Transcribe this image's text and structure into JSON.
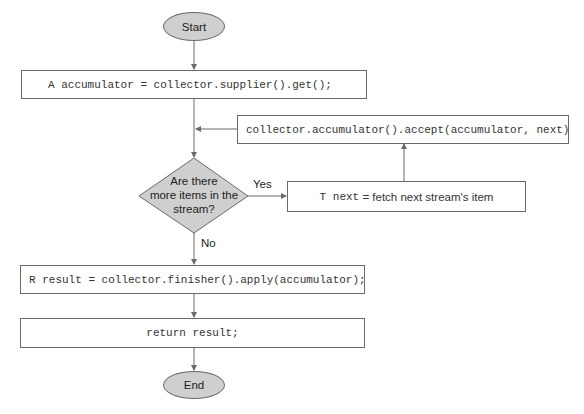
{
  "diagram": {
    "type": "flowchart",
    "colors": {
      "line": "#6b6b6b",
      "terminal_fill": "#cfcfcf",
      "decision_fill": "#cfcfcf",
      "box_fill": "#ffffff"
    },
    "nodes": {
      "start": {
        "label": "Start",
        "shape": "ellipse"
      },
      "init": {
        "label": "A accumulator = collector.supplier().get();",
        "shape": "rect"
      },
      "decision": {
        "shape": "diamond",
        "line1": "Are there",
        "line2": "more items in the",
        "line3": "stream?"
      },
      "fetch": {
        "shape": "rect",
        "code": "T next",
        "text": " = fetch next stream's item"
      },
      "accept": {
        "label": "collector.accumulator().accept(accumulator, next)",
        "shape": "rect"
      },
      "finish": {
        "label": "R result = collector.finisher().apply(accumulator);",
        "shape": "rect"
      },
      "return": {
        "label": "return result;",
        "shape": "rect"
      },
      "end": {
        "label": "End",
        "shape": "ellipse"
      }
    },
    "edges": [
      {
        "from": "start",
        "to": "init",
        "label": ""
      },
      {
        "from": "init",
        "to": "decision",
        "label": ""
      },
      {
        "from": "decision",
        "to": "fetch",
        "label": "Yes"
      },
      {
        "from": "fetch",
        "to": "accept",
        "label": ""
      },
      {
        "from": "accept",
        "to": "decision",
        "label": ""
      },
      {
        "from": "decision",
        "to": "finish",
        "label": "No"
      },
      {
        "from": "finish",
        "to": "return",
        "label": ""
      },
      {
        "from": "return",
        "to": "end",
        "label": ""
      }
    ],
    "edge_labels": {
      "yes": "Yes",
      "no": "No"
    }
  }
}
